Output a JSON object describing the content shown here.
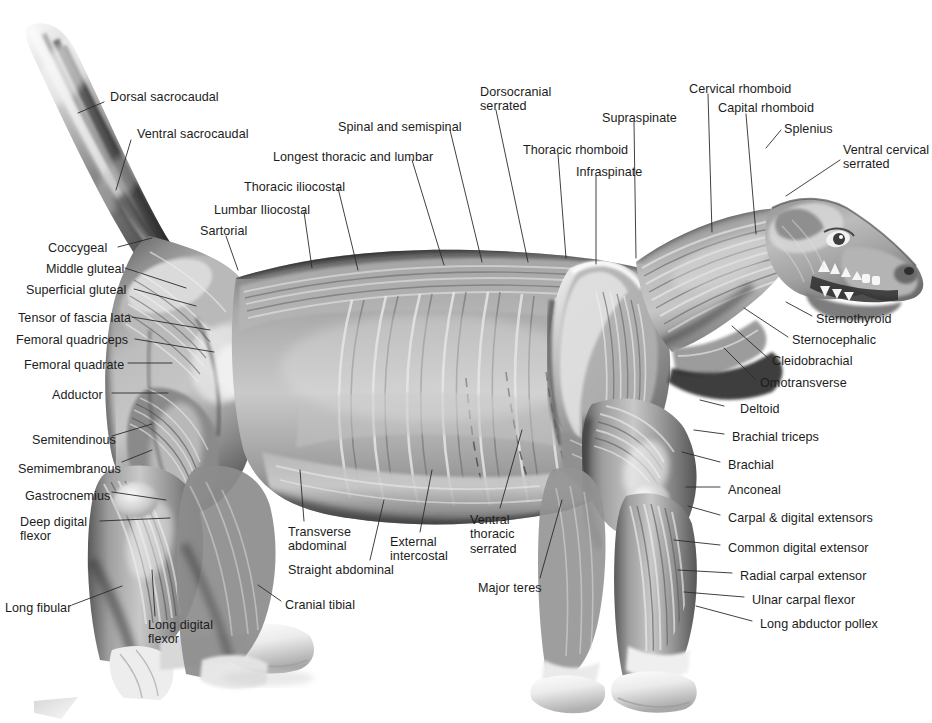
{
  "figure": {
    "style": "grayscale pencil / airbrush anatomical illustration",
    "width": 932,
    "height": 723,
    "background_color": "#ffffff",
    "label_color": "#1c1c1c",
    "leader_color": "#2b2b2b",
    "label_font_size_px": 12.6
  },
  "labels": [
    {
      "id": "dorsal-sacrocaudal",
      "text": "Dorsal sacrocaudal",
      "x": 110,
      "y": 90,
      "align": "left",
      "leader": [
        [
          104,
          102
        ],
        [
          78,
          113
        ]
      ]
    },
    {
      "id": "ventral-sacrocaudal",
      "text": "Ventral sacrocaudal",
      "x": 137,
      "y": 127,
      "align": "left",
      "leader": [
        [
          131,
          140
        ],
        [
          116,
          190
        ]
      ]
    },
    {
      "id": "coccygeal",
      "text": "Coccygeal",
      "x": 48,
      "y": 241,
      "align": "left",
      "leader": [
        [
          118,
          247
        ],
        [
          152,
          238
        ]
      ]
    },
    {
      "id": "middle-gluteal",
      "text": "Middle gluteal",
      "x": 46,
      "y": 262,
      "align": "left",
      "leader": [
        [
          125,
          268
        ],
        [
          186,
          288
        ]
      ]
    },
    {
      "id": "superficial-gluteal",
      "text": "Superficial gluteal",
      "x": 26,
      "y": 283,
      "align": "left",
      "leader": [
        [
          134,
          289
        ],
        [
          196,
          306
        ]
      ]
    },
    {
      "id": "tensor-of-fascia-lata",
      "text": "Tensor of fascia lata",
      "x": 18,
      "y": 311,
      "align": "left",
      "leader": [
        [
          132,
          317
        ],
        [
          210,
          330
        ]
      ]
    },
    {
      "id": "femoral-quadriceps",
      "text": "Femoral quadriceps",
      "x": 16,
      "y": 333,
      "align": "left",
      "leader": [
        [
          135,
          339
        ],
        [
          214,
          352
        ]
      ]
    },
    {
      "id": "femoral-quadrate",
      "text": "Femoral quadrate",
      "x": 24,
      "y": 358,
      "align": "left",
      "leader": [
        [
          128,
          363
        ],
        [
          172,
          363
        ]
      ]
    },
    {
      "id": "adductor",
      "text": "Adductor",
      "x": 52,
      "y": 388,
      "align": "left",
      "leader": [
        [
          112,
          393
        ],
        [
          168,
          393
        ]
      ]
    },
    {
      "id": "semitendinous",
      "text": "Semitendinous",
      "x": 32,
      "y": 433,
      "align": "left",
      "leader": [
        [
          112,
          436
        ],
        [
          152,
          424
        ]
      ]
    },
    {
      "id": "semimembranous",
      "text": "Semimembranous",
      "x": 18,
      "y": 462,
      "align": "left",
      "leader": [
        [
          122,
          462
        ],
        [
          152,
          450
        ]
      ]
    },
    {
      "id": "gastrocnemius",
      "text": "Gastrocnemius",
      "x": 25,
      "y": 489,
      "align": "left",
      "leader": [
        [
          112,
          492
        ],
        [
          166,
          500
        ]
      ]
    },
    {
      "id": "deep-digital-flexor",
      "text": "Deep digital\nflexor",
      "x": 20,
      "y": 515,
      "align": "left",
      "leader": [
        [
          100,
          521
        ],
        [
          170,
          518
        ]
      ]
    },
    {
      "id": "long-fibular",
      "text": "Long fibular",
      "x": 5,
      "y": 601,
      "align": "left",
      "leader": [
        [
          72,
          605
        ],
        [
          122,
          586
        ]
      ]
    },
    {
      "id": "long-digital-flexor",
      "text": "Long digital\nflexor",
      "x": 148,
      "y": 618,
      "align": "left",
      "leader": [
        [
          155,
          616
        ],
        [
          152,
          570
        ]
      ]
    },
    {
      "id": "cranial-tibial",
      "text": "Cranial tibial",
      "x": 285,
      "y": 598,
      "align": "left",
      "leader": [
        [
          281,
          601
        ],
        [
          258,
          585
        ]
      ]
    },
    {
      "id": "sartorial",
      "text": "Sartorial",
      "x": 200,
      "y": 224,
      "align": "left",
      "leader": [
        [
          226,
          236
        ],
        [
          238,
          270
        ]
      ]
    },
    {
      "id": "lumbar-iliocostal",
      "text": "Lumbar Iliocostal",
      "x": 214,
      "y": 203,
      "align": "left",
      "leader": [
        [
          304,
          212
        ],
        [
          312,
          268
        ]
      ]
    },
    {
      "id": "thoracic-iliocostal",
      "text": "Thoracic iliocostal",
      "x": 244,
      "y": 180,
      "align": "left",
      "leader": [
        [
          338,
          188
        ],
        [
          358,
          270
        ]
      ]
    },
    {
      "id": "longest-thoracic-lumbar",
      "text": "Longest thoracic and lumbar",
      "x": 273,
      "y": 150,
      "align": "left",
      "leader": [
        [
          412,
          160
        ],
        [
          444,
          265
        ]
      ]
    },
    {
      "id": "spinal-and-semispinal",
      "text": "Spinal and semispinal",
      "x": 338,
      "y": 120,
      "align": "left",
      "leader": [
        [
          450,
          130
        ],
        [
          482,
          262
        ]
      ]
    },
    {
      "id": "dorsocranial-serrated",
      "text": "Dorsocranial\nserrated",
      "x": 480,
      "y": 85,
      "align": "left",
      "leader": [
        [
          496,
          110
        ],
        [
          528,
          262
        ]
      ]
    },
    {
      "id": "thoracic-rhomboid",
      "text": "Thoracic rhomboid",
      "x": 523,
      "y": 143,
      "align": "left",
      "leader": [
        [
          558,
          154
        ],
        [
          566,
          258
        ]
      ]
    },
    {
      "id": "infraspinate",
      "text": "Infraspinate",
      "x": 576,
      "y": 165,
      "align": "left",
      "leader": [
        [
          596,
          176
        ],
        [
          596,
          264
        ]
      ]
    },
    {
      "id": "supraspinate",
      "text": "Supraspinate",
      "x": 602,
      "y": 111,
      "align": "left",
      "leader": [
        [
          634,
          122
        ],
        [
          636,
          258
        ]
      ]
    },
    {
      "id": "cervical-rhomboid",
      "text": "Cervical rhomboid",
      "x": 689,
      "y": 82,
      "align": "left",
      "leader": [
        [
          708,
          94
        ],
        [
          712,
          232
        ]
      ]
    },
    {
      "id": "capital-rhomboid",
      "text": "Capital rhomboid",
      "x": 718,
      "y": 101,
      "align": "left",
      "leader": [
        [
          746,
          114
        ],
        [
          756,
          234
        ]
      ]
    },
    {
      "id": "splenius",
      "text": "Splenius",
      "x": 784,
      "y": 122,
      "align": "left",
      "leader": [
        [
          781,
          130
        ],
        [
          766,
          148
        ]
      ]
    },
    {
      "id": "ventral-cervical-serrated",
      "text": "Ventral cervical\nserrated",
      "x": 843,
      "y": 143,
      "align": "left",
      "leader": [
        [
          840,
          160
        ],
        [
          786,
          196
        ]
      ]
    },
    {
      "id": "sternothyroid",
      "text": "Sternothyroid",
      "x": 816,
      "y": 312,
      "align": "left",
      "leader": [
        [
          812,
          316
        ],
        [
          786,
          302
        ]
      ]
    },
    {
      "id": "sternocephalic",
      "text": "Sternocephalic",
      "x": 792,
      "y": 333,
      "align": "left",
      "leader": [
        [
          788,
          337
        ],
        [
          744,
          308
        ]
      ]
    },
    {
      "id": "cleidobrachial",
      "text": "Cleidobrachial",
      "x": 772,
      "y": 354,
      "align": "left",
      "leader": [
        [
          768,
          358
        ],
        [
          732,
          326
        ]
      ]
    },
    {
      "id": "omotransverse",
      "text": "Omotransverse",
      "x": 760,
      "y": 376,
      "align": "left",
      "leader": [
        [
          756,
          380
        ],
        [
          724,
          348
        ]
      ]
    },
    {
      "id": "deltoid",
      "text": "Deltoid",
      "x": 740,
      "y": 402,
      "align": "left",
      "leader": [
        [
          724,
          406
        ],
        [
          700,
          400
        ]
      ]
    },
    {
      "id": "brachial-triceps",
      "text": "Brachial triceps",
      "x": 732,
      "y": 430,
      "align": "left",
      "leader": [
        [
          724,
          434
        ],
        [
          694,
          430
        ]
      ]
    },
    {
      "id": "brachial",
      "text": "Brachial",
      "x": 728,
      "y": 458,
      "align": "left",
      "leader": [
        [
          720,
          462
        ],
        [
          682,
          452
        ]
      ]
    },
    {
      "id": "anconeal",
      "text": "Anconeal",
      "x": 728,
      "y": 483,
      "align": "left",
      "leader": [
        [
          720,
          487
        ],
        [
          686,
          487
        ]
      ]
    },
    {
      "id": "carpal-digital-extensors",
      "text": "Carpal & digital extensors",
      "x": 728,
      "y": 511,
      "align": "left",
      "leader": [
        [
          720,
          515
        ],
        [
          688,
          506
        ]
      ]
    },
    {
      "id": "common-digital-extensor",
      "text": "Common digital extensor",
      "x": 728,
      "y": 541,
      "align": "left",
      "leader": [
        [
          720,
          545
        ],
        [
          674,
          540
        ]
      ]
    },
    {
      "id": "radial-carpal-extensor",
      "text": "Radial carpal extensor",
      "x": 740,
      "y": 569,
      "align": "left",
      "leader": [
        [
          732,
          573
        ],
        [
          678,
          570
        ]
      ]
    },
    {
      "id": "ulnar-carpal-flexor",
      "text": "Ulnar carpal flexor",
      "x": 752,
      "y": 593,
      "align": "left",
      "leader": [
        [
          744,
          597
        ],
        [
          684,
          592
        ]
      ]
    },
    {
      "id": "long-abductor-pollex",
      "text": "Long abductor pollex",
      "x": 760,
      "y": 617,
      "align": "left",
      "leader": [
        [
          752,
          621
        ],
        [
          696,
          606
        ]
      ]
    },
    {
      "id": "transverse-abdominal",
      "text": "Transverse\nabdominal",
      "x": 288,
      "y": 525,
      "align": "left",
      "leader": [
        [
          304,
          521
        ],
        [
          300,
          470
        ]
      ]
    },
    {
      "id": "straight-abdominal",
      "text": "Straight abdominal",
      "x": 288,
      "y": 563,
      "align": "left",
      "leader": [
        [
          370,
          560
        ],
        [
          384,
          500
        ]
      ]
    },
    {
      "id": "external-intercostal",
      "text": "External\nintercostal",
      "x": 390,
      "y": 535,
      "align": "left",
      "leader": [
        [
          420,
          532
        ],
        [
          432,
          470
        ]
      ]
    },
    {
      "id": "ventral-thoracic-serrated",
      "text": "Ventral\nthoracic\nserrated",
      "x": 470,
      "y": 513,
      "align": "left",
      "leader": [
        [
          500,
          508
        ],
        [
          522,
          430
        ]
      ]
    },
    {
      "id": "major-teres",
      "text": "Major teres",
      "x": 478,
      "y": 581,
      "align": "left",
      "leader": [
        [
          540,
          578
        ],
        [
          562,
          500
        ]
      ]
    }
  ]
}
